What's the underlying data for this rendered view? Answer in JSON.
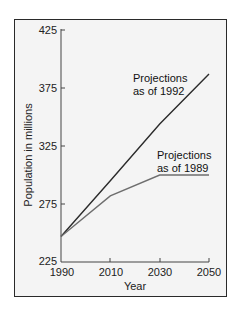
{
  "chart_data": {
    "type": "line",
    "title": "",
    "xlabel": "Year",
    "ylabel": "Population in millions",
    "x": [
      1990,
      2010,
      2030,
      2050
    ],
    "xticks": [
      "1990",
      "2010",
      "2030",
      "2050"
    ],
    "yticks": [
      "225",
      "275",
      "325",
      "375",
      "425"
    ],
    "ylim": [
      225,
      425
    ],
    "xlim": [
      1990,
      2050
    ],
    "grid": false,
    "series": [
      {
        "name": "Projections as of 1992",
        "label_lines": [
          "Projections",
          "as of 1992"
        ],
        "color": "#2b2b2b",
        "values": [
          247,
          295,
          344,
          387
        ]
      },
      {
        "name": "Projections as of 1989",
        "label_lines": [
          "Projections",
          "as of 1989"
        ],
        "color": "#6e6e6e",
        "values": [
          247,
          282,
          300,
          300
        ]
      }
    ]
  }
}
